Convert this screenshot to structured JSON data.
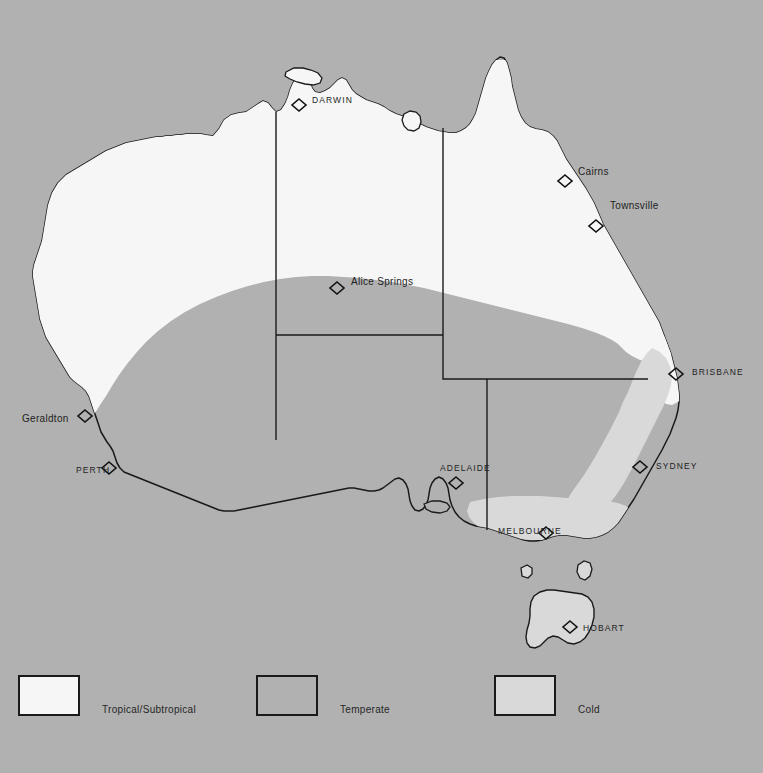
{
  "map": {
    "title": "Climate zones of Australia",
    "background_color": "#b1b1b1",
    "zones": {
      "tropical_color": "#f6f6f6",
      "temperate_color": "#b1b1b1",
      "cold_color": "#d9d9d9",
      "outline_color": "#1a1a1a"
    },
    "cities": [
      {
        "name": "DARWIN",
        "style": "caps",
        "x": 312,
        "y": 100,
        "marker_x": 299,
        "marker_y": 105
      },
      {
        "name": "Cairns",
        "style": "title",
        "x": 578,
        "y": 172,
        "marker_x": 565,
        "marker_y": 181
      },
      {
        "name": "Townsville",
        "style": "title",
        "x": 610,
        "y": 206,
        "marker_x": 596,
        "marker_y": 226
      },
      {
        "name": "Alice Springs",
        "style": "title",
        "x": 351,
        "y": 282,
        "marker_x": 337,
        "marker_y": 288
      },
      {
        "name": "BRISBANE",
        "style": "caps",
        "x": 692,
        "y": 372,
        "marker_x": 676,
        "marker_y": 374
      },
      {
        "name": "Geraldton",
        "style": "title",
        "x": 22,
        "y": 419,
        "marker_x": 85,
        "marker_y": 416
      },
      {
        "name": "SYDNEY",
        "style": "caps",
        "x": 656,
        "y": 466,
        "marker_x": 640,
        "marker_y": 467
      },
      {
        "name": "PERTH",
        "style": "caps",
        "x": 76,
        "y": 470,
        "marker_x": 109,
        "marker_y": 468
      },
      {
        "name": "ADELAIDE",
        "style": "caps",
        "x": 440,
        "y": 468,
        "marker_x": 456,
        "marker_y": 483
      },
      {
        "name": "MELBOURNE",
        "style": "caps",
        "x": 498,
        "y": 531,
        "marker_x": 546,
        "marker_y": 533
      },
      {
        "name": "HOBART",
        "style": "caps",
        "x": 583,
        "y": 628,
        "marker_x": 570,
        "marker_y": 627
      }
    ]
  },
  "legend": {
    "items": [
      {
        "label": "Tropical/Subtropical",
        "swatch": "sw-tropical",
        "color": "#f6f6f6",
        "x": 18,
        "y": 675
      },
      {
        "label": "Temperate",
        "swatch": "sw-temperate",
        "color": "#b1b1b1",
        "x": 256,
        "y": 675
      },
      {
        "label": "Cold",
        "swatch": "sw-cold",
        "color": "#d9d9d9",
        "x": 494,
        "y": 675
      }
    ]
  }
}
